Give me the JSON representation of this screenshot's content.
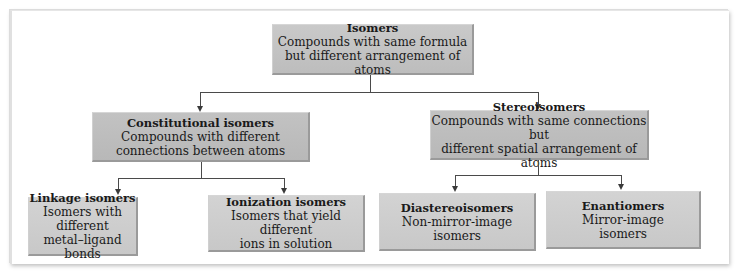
{
  "diagram": {
    "root": {
      "title": "Isomers",
      "line1": "Compounds with same formula",
      "line2": "but different arrangement of atoms"
    },
    "level1": [
      {
        "title": "Constitutional isomers",
        "line1": "Compounds with different",
        "line2": "connections between atoms"
      },
      {
        "title": "Stereoisomers",
        "line1": "Compounds with same connections but",
        "line2": "different spatial arrangement of atoms"
      }
    ],
    "level2": [
      {
        "title": "Linkage isomers",
        "line1": "Isomers with different",
        "line2": "metal–ligand bonds"
      },
      {
        "title": "Ionization isomers",
        "line1": "Isomers that yield different",
        "line2": "ions in solution"
      },
      {
        "title": "Diastereoisomers",
        "line1": "Non-mirror-image",
        "line2": "isomers"
      },
      {
        "title": "Enantiomers",
        "line1": "Mirror-image",
        "line2": "isomers"
      }
    ],
    "colors": {
      "box_fill": "#c4c4c4",
      "box_shadow": "#9a9a9a",
      "connector": "#4a4a4a",
      "background": "#ffffff"
    }
  }
}
